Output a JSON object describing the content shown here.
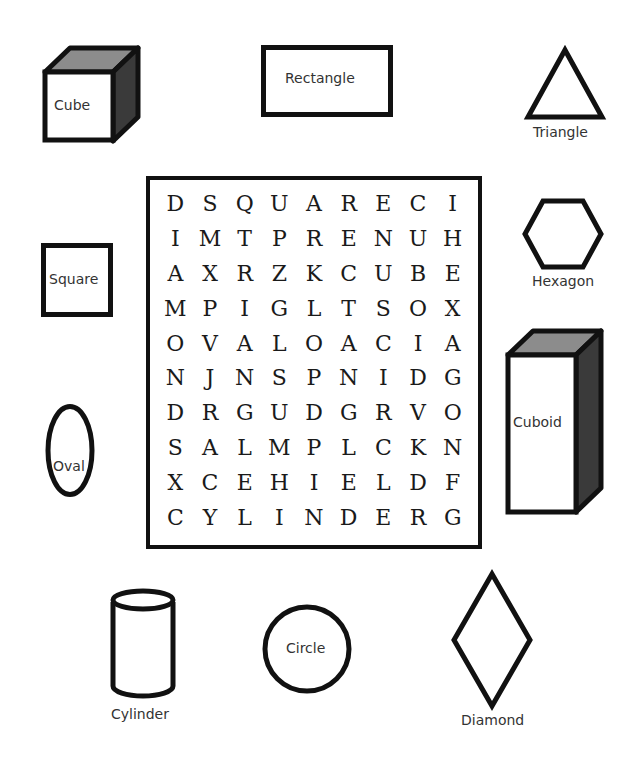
{
  "worksheet": {
    "grid": [
      [
        "D",
        "S",
        "Q",
        "U",
        "A",
        "R",
        "E",
        "C",
        "I"
      ],
      [
        "I",
        "M",
        "T",
        "P",
        "R",
        "E",
        "N",
        "U",
        "H"
      ],
      [
        "A",
        "X",
        "R",
        "Z",
        "K",
        "C",
        "U",
        "B",
        "E"
      ],
      [
        "M",
        "P",
        "I",
        "G",
        "L",
        "T",
        "S",
        "O",
        "X"
      ],
      [
        "O",
        "V",
        "A",
        "L",
        "O",
        "A",
        "C",
        "I",
        "A"
      ],
      [
        "N",
        "J",
        "N",
        "S",
        "P",
        "N",
        "I",
        "D",
        "G"
      ],
      [
        "D",
        "R",
        "G",
        "U",
        "D",
        "G",
        "R",
        "V",
        "O"
      ],
      [
        "S",
        "A",
        "L",
        "M",
        "P",
        "L",
        "C",
        "K",
        "N"
      ],
      [
        "X",
        "C",
        "E",
        "H",
        "I",
        "E",
        "L",
        "D",
        "F"
      ],
      [
        "C",
        "Y",
        "L",
        "I",
        "N",
        "D",
        "E",
        "R",
        "G"
      ]
    ],
    "shapes": {
      "cube": "Cube",
      "rectangle": "Rectangle",
      "triangle": "Triangle",
      "hexagon": "Hexagon",
      "square": "Square",
      "cuboid": "Cuboid",
      "oval": "Oval",
      "cylinder": "Cylinder",
      "circle": "Circle",
      "diamond": "Diamond"
    },
    "colors": {
      "stroke": "#111111",
      "top_face": "#8c8c8c",
      "side_face": "#3a3a3a"
    }
  }
}
